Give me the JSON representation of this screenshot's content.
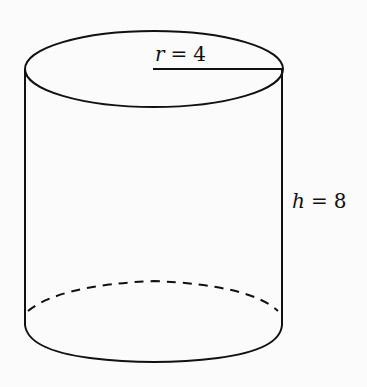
{
  "figure": {
    "shape": "cylinder",
    "radius_label": {
      "variable": "r",
      "equals": "=",
      "value": "4"
    },
    "height_label": {
      "variable": "h",
      "equals": "=",
      "value": "8"
    },
    "colors": {
      "stroke": "#111111",
      "background": "#fbfbfb"
    }
  }
}
